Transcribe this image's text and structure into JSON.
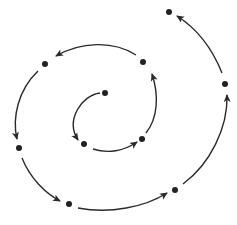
{
  "diagram": {
    "type": "spiral-sequence",
    "colors": {
      "background": "#ffffff",
      "stroke": "#2a2a2a",
      "dot": "#222222"
    },
    "points": [
      {
        "id": "p0",
        "x": 105,
        "y": 93
      },
      {
        "id": "p1",
        "x": 84,
        "y": 144
      },
      {
        "id": "p2",
        "x": 142,
        "y": 139
      },
      {
        "id": "p3",
        "x": 143,
        "y": 62
      },
      {
        "id": "p4",
        "x": 45,
        "y": 64
      },
      {
        "id": "p5",
        "x": 19,
        "y": 148
      },
      {
        "id": "p6",
        "x": 69,
        "y": 204
      },
      {
        "id": "p7",
        "x": 175,
        "y": 190
      },
      {
        "id": "p8",
        "x": 225,
        "y": 84
      },
      {
        "id": "p9",
        "x": 169,
        "y": 12
      }
    ],
    "arrows": [
      {
        "from": "p0",
        "to": "p1",
        "d": "M100,93 C82,95 65,120 78,140"
      },
      {
        "from": "p1",
        "to": "p2",
        "d": "M93,149 C108,154 124,151 137,142"
      },
      {
        "from": "p2",
        "to": "p3",
        "d": "M146,133 C158,118 159,95 152,74"
      },
      {
        "from": "p3",
        "to": "p4",
        "d": "M136,55 C113,40 80,42 56,56"
      },
      {
        "from": "p4",
        "to": "p5",
        "d": "M38,71 C18,90 12,118 17,139"
      },
      {
        "from": "p5",
        "to": "p6",
        "d": "M22,158 C30,178 45,193 60,201"
      },
      {
        "from": "p6",
        "to": "p7",
        "d": "M78,208 C110,214 145,207 167,193"
      },
      {
        "from": "p7",
        "to": "p8",
        "d": "M183,184 C210,164 228,128 227,95"
      },
      {
        "from": "p8",
        "to": "p9",
        "d": "M222,73 C212,48 196,28 177,16"
      }
    ]
  }
}
